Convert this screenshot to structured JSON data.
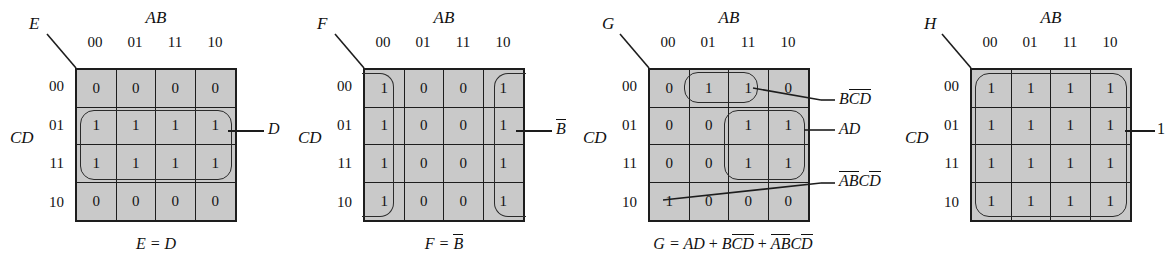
{
  "figure": {
    "type": "karnaugh-maps",
    "count": 4,
    "col_var_label": "AB",
    "row_var_label": "CD",
    "col_headers": [
      "00",
      "01",
      "11",
      "10"
    ],
    "row_headers": [
      "00",
      "01",
      "11",
      "10"
    ],
    "cell_fill_color": "#c9c9c9",
    "line_color": "#1d1d1d"
  },
  "maps": [
    {
      "name": "E",
      "output_label": "E",
      "cells": [
        [
          "0",
          "0",
          "0",
          "0"
        ],
        [
          "1",
          "1",
          "1",
          "1"
        ],
        [
          "1",
          "1",
          "1",
          "1"
        ],
        [
          "0",
          "0",
          "0",
          "0"
        ]
      ],
      "groups": [
        {
          "term": "D",
          "term_plain": "D",
          "rows": [
            1,
            2
          ],
          "cols": [
            0,
            3
          ]
        }
      ],
      "equation": "E = D",
      "equation_parts": {
        "lhs": "E",
        "eq": "=",
        "rhs": "D"
      }
    },
    {
      "name": "F",
      "output_label": "F",
      "cells": [
        [
          "1",
          "0",
          "0",
          "1"
        ],
        [
          "1",
          "0",
          "0",
          "1"
        ],
        [
          "1",
          "0",
          "0",
          "1"
        ],
        [
          "1",
          "0",
          "0",
          "1"
        ]
      ],
      "groups": [
        {
          "term": "B̅",
          "term_base": "B",
          "rows": [
            0,
            3
          ],
          "cols": [
            0,
            0
          ],
          "wrap": true
        },
        {
          "term": "B̅",
          "term_base": "B",
          "rows": [
            0,
            3
          ],
          "cols": [
            3,
            3
          ],
          "wrap": true
        }
      ],
      "equation": "F = B̅",
      "equation_parts": {
        "lhs": "F",
        "eq": "=",
        "rhs": "B",
        "rhs_bar": true
      }
    },
    {
      "name": "G",
      "output_label": "G",
      "cells": [
        [
          "0",
          "1",
          "1",
          "0"
        ],
        [
          "0",
          "0",
          "1",
          "1"
        ],
        [
          "0",
          "0",
          "1",
          "1"
        ],
        [
          "1",
          "0",
          "0",
          "0"
        ]
      ],
      "groups": [
        {
          "term": "BC̅D̅",
          "rows": [
            0,
            0
          ],
          "cols": [
            1,
            2
          ]
        },
        {
          "term": "AD",
          "rows": [
            1,
            2
          ],
          "cols": [
            2,
            3
          ]
        },
        {
          "term": "A̅B̅CD̅",
          "rows": [
            3,
            3
          ],
          "cols": [
            0,
            0
          ],
          "pointer_only": true
        }
      ],
      "annotations": [
        {
          "label": "BC̅D̅",
          "target_row": 0,
          "target_col": 2
        },
        {
          "label": "AD",
          "target_row": 1,
          "target_col": 3
        },
        {
          "label": "A̅B̅CD̅",
          "target_row": 3,
          "target_col": 0
        }
      ],
      "equation": "G = AD + BC̅D̅ + A̅B̅CD̅"
    },
    {
      "name": "H",
      "output_label": "H",
      "cells": [
        [
          "1",
          "1",
          "1",
          "1"
        ],
        [
          "1",
          "1",
          "1",
          "1"
        ],
        [
          "1",
          "1",
          "1",
          "1"
        ],
        [
          "1",
          "1",
          "1",
          "1"
        ]
      ],
      "groups": [
        {
          "term": "1",
          "rows": [
            0,
            3
          ],
          "cols": [
            0,
            3
          ]
        }
      ],
      "annotations": [
        {
          "label": "1",
          "target_row": 1,
          "target_col": 3
        }
      ],
      "equation": ""
    }
  ],
  "labels": {
    "map1_term_D": "D",
    "map2_term_Bbar": "B",
    "map3_term_BCbarDbar_1": "B",
    "map3_term_BCbarDbar_2": "C",
    "map3_term_BCbarDbar_3": "D",
    "map3_term_AD": "AD",
    "map3_term_ABCD_1": "A",
    "map3_term_ABCD_2": "B",
    "map3_term_ABCD_3": "C",
    "map3_term_ABCD_4": "D",
    "map4_term_one": "1",
    "eq1_lhs": "E",
    "eq1_rhs": "D",
    "eq2_lhs": "F",
    "eq2_rhs": "B",
    "eq3_lhs": "G",
    "eq3_t1": "AD",
    "eq3_t2a": "B",
    "eq3_t2b": "C",
    "eq3_t2c": "D",
    "eq3_t3a": "A",
    "eq3_t3b": "B",
    "eq3_t3c": "C",
    "eq3_t3d": "D",
    "equals": "=",
    "plus": "+"
  }
}
